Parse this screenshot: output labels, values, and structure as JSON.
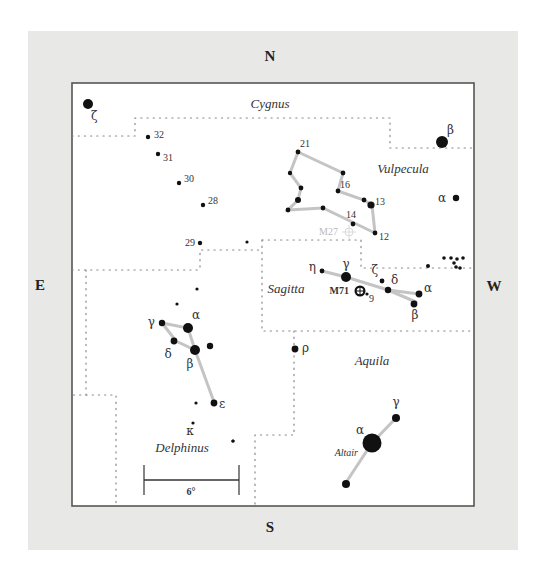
{
  "compass": {
    "north": "N",
    "south": "S",
    "east": "E",
    "west": "W"
  },
  "constellations": {
    "cygnus": "Cygnus",
    "vulpecula": "Vulpecula",
    "sagitta": "Sagitta",
    "aquila": "Aquila",
    "delphinus": "Delphinus"
  },
  "scale_bar": {
    "label": "6°"
  },
  "objects": {
    "m71": "M71",
    "m27": "M27",
    "altair": "Altair"
  },
  "star_labels": {
    "cyg_zeta": "ζ",
    "cyg_32": "32",
    "cyg_31": "31",
    "cyg_30": "30",
    "cyg_28": "28",
    "cyg_29": "29",
    "cyg_beta": "β",
    "vul_21": "21",
    "vul_16": "16",
    "vul_13": "13",
    "vul_14": "14",
    "vul_12": "12",
    "vul_alpha": "α",
    "sge_eta": "η",
    "sge_gamma": "γ",
    "sge_zeta": "ζ",
    "sge_delta": "δ",
    "sge_alpha": "α",
    "sge_beta": "β",
    "sge_9": "9",
    "del_gamma": "γ",
    "del_alpha": "α",
    "del_delta": "δ",
    "del_beta": "β",
    "del_epsilon": "ε",
    "del_kappa": "κ",
    "aql_rho": "ρ",
    "aql_alpha": "α",
    "aql_gamma": "γ"
  }
}
